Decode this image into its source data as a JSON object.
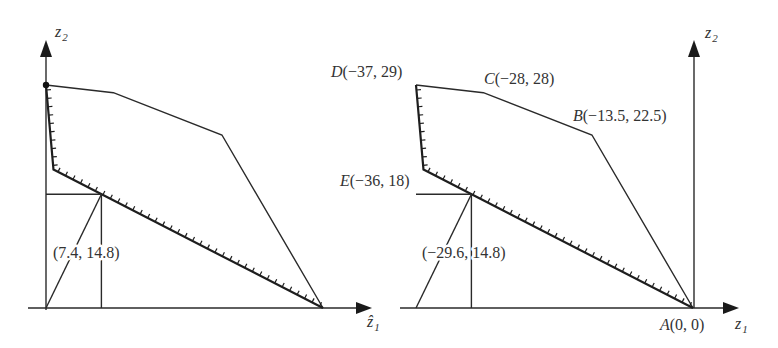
{
  "figure": {
    "left_panel": {
      "x_axis": {
        "symbol": "ẑ",
        "subscript": "1"
      },
      "y_axis": {
        "symbol": "z",
        "subscript": "2"
      },
      "frontier_vertices": [
        [
          0,
          29
        ],
        [
          9,
          28
        ],
        [
          23.5,
          22.5
        ],
        [
          37,
          0
        ]
      ],
      "hatched_vertices": [
        [
          0,
          29
        ],
        [
          1,
          18
        ],
        [
          37,
          0
        ]
      ],
      "highlight_point": [
        0,
        29
      ],
      "ideal_point": [
        7.4,
        14.8
      ],
      "ideal_point_label": "(7.4, 14.8)"
    },
    "right_panel": {
      "x_axis": {
        "symbol": "z",
        "subscript": "1"
      },
      "y_axis": {
        "symbol": "z",
        "subscript": "2"
      },
      "frontier_vertices": [
        [
          -37,
          29
        ],
        [
          -28,
          28
        ],
        [
          -13.5,
          22.5
        ],
        [
          0,
          0
        ]
      ],
      "hatched_vertices": [
        [
          -37,
          29
        ],
        [
          -36,
          18
        ],
        [
          0,
          0
        ]
      ],
      "ideal_point": [
        -29.6,
        14.8
      ],
      "ideal_point_label": "(−29.6, 14.8)",
      "points": {
        "A": {
          "letter": "A",
          "coords": "(0, 0)",
          "value": [
            0,
            0
          ]
        },
        "B": {
          "letter": "B",
          "coords": "(−13.5, 22.5)",
          "value": [
            -13.5,
            22.5
          ]
        },
        "C": {
          "letter": "C",
          "coords": "(−28, 28)",
          "value": [
            -28,
            28
          ]
        },
        "D": {
          "letter": "D",
          "coords": "(−37, 29)",
          "value": [
            -37,
            29
          ]
        },
        "E": {
          "letter": "E",
          "coords": "(−36, 18)",
          "value": [
            -36,
            18
          ]
        }
      }
    }
  }
}
